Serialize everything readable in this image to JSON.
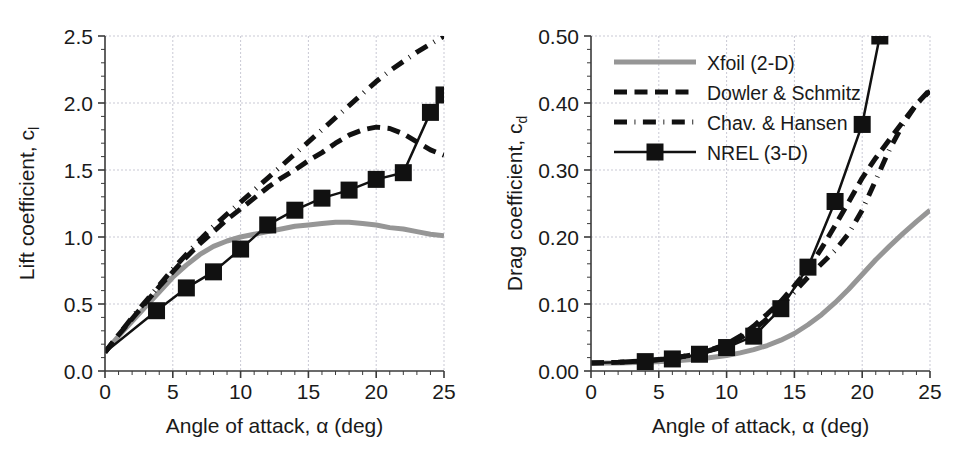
{
  "figure": {
    "background": "#ffffff",
    "panels": [
      "lift",
      "drag"
    ]
  },
  "legend": {
    "position": "top-left-of-right-panel",
    "entries": [
      {
        "label": "Xfoil (2-D)",
        "style": "solid",
        "color": "#969696",
        "marker": "none",
        "width": 5
      },
      {
        "label": "Dowler & Schmitz",
        "style": "dashed",
        "color": "#111111",
        "marker": "none",
        "width": 5
      },
      {
        "label": "Chav. & Hansen",
        "style": "dash-dot",
        "color": "#111111",
        "marker": "none",
        "width": 5
      },
      {
        "label": "NREL (3-D)",
        "style": "solid",
        "color": "#111111",
        "marker": "square",
        "width": 2.5
      }
    ]
  },
  "chart_data": [
    {
      "id": "lift",
      "type": "line",
      "title": "",
      "xlabel": "Angle of attack, α (deg)",
      "ylabel": "Lift coefficient, c",
      "ylabel_sub": "l",
      "xlim": [
        0,
        25
      ],
      "ylim": [
        0.0,
        2.5
      ],
      "xticks": [
        0,
        5,
        10,
        15,
        20,
        25
      ],
      "yticks": [
        0.0,
        0.5,
        1.0,
        1.5,
        2.0,
        2.5
      ],
      "xticklabels": [
        "0",
        "5",
        "10",
        "15",
        "20",
        "25"
      ],
      "yticklabels": [
        "0.0",
        "0.5",
        "1.0",
        "1.5",
        "2.0",
        "2.5"
      ],
      "minor_ticks_per_interval": 5,
      "grid": true,
      "grid_color": "#c9c9d4",
      "legend": false,
      "series": [
        {
          "name": "Xfoil (2-D)",
          "style": "solid",
          "color": "#969696",
          "width": 5,
          "marker": "none",
          "x": [
            0,
            1,
            2,
            3,
            4,
            5,
            6,
            7,
            8,
            9,
            10,
            11,
            12,
            13,
            14,
            15,
            16,
            17,
            18,
            19,
            20,
            21,
            22,
            23,
            24,
            25
          ],
          "y": [
            0.14,
            0.26,
            0.37,
            0.48,
            0.59,
            0.7,
            0.79,
            0.87,
            0.93,
            0.97,
            1.0,
            1.02,
            1.04,
            1.06,
            1.08,
            1.09,
            1.1,
            1.11,
            1.11,
            1.1,
            1.09,
            1.07,
            1.06,
            1.04,
            1.02,
            1.01
          ]
        },
        {
          "name": "Dowler & Schmitz",
          "style": "dashed",
          "color": "#111111",
          "width": 5,
          "marker": "none",
          "x": [
            0,
            1,
            2,
            3,
            4,
            5,
            6,
            7,
            8,
            9,
            10,
            11,
            12,
            13,
            14,
            15,
            16,
            17,
            18,
            19,
            20,
            21,
            22,
            23,
            24,
            25
          ],
          "y": [
            0.14,
            0.27,
            0.39,
            0.51,
            0.63,
            0.74,
            0.85,
            0.95,
            1.04,
            1.13,
            1.21,
            1.29,
            1.37,
            1.44,
            1.5,
            1.57,
            1.63,
            1.7,
            1.76,
            1.8,
            1.82,
            1.81,
            1.77,
            1.71,
            1.65,
            1.61
          ]
        },
        {
          "name": "Chav. & Hansen",
          "style": "dash-dot",
          "color": "#111111",
          "width": 5,
          "marker": "none",
          "x": [
            0,
            1,
            2,
            3,
            4,
            5,
            6,
            7,
            8,
            9,
            10,
            11,
            12,
            13,
            14,
            15,
            16,
            17,
            18,
            19,
            20,
            21,
            22,
            23,
            24,
            25
          ],
          "y": [
            0.14,
            0.27,
            0.4,
            0.52,
            0.64,
            0.76,
            0.87,
            0.98,
            1.08,
            1.17,
            1.26,
            1.35,
            1.44,
            1.53,
            1.62,
            1.71,
            1.8,
            1.89,
            1.98,
            2.07,
            2.16,
            2.24,
            2.31,
            2.38,
            2.44,
            2.5
          ]
        },
        {
          "name": "NREL (3-D)",
          "style": "solid",
          "color": "#111111",
          "width": 2.5,
          "marker": "square",
          "marker_size": 17,
          "x": [
            0,
            3.8,
            6.0,
            8.0,
            10.0,
            12.0,
            14.0,
            16.0,
            18.0,
            20.0,
            22.0,
            24.0,
            25.0
          ],
          "y": [
            0.14,
            0.45,
            0.62,
            0.74,
            0.91,
            1.09,
            1.2,
            1.29,
            1.35,
            1.43,
            1.48,
            1.93,
            2.06
          ]
        }
      ]
    },
    {
      "id": "drag",
      "type": "line",
      "title": "",
      "xlabel": "Angle of attack, α (deg)",
      "ylabel": "Drag coefficient, c",
      "ylabel_sub": "d",
      "xlim": [
        0,
        25
      ],
      "ylim": [
        0.0,
        0.5
      ],
      "xticks": [
        0,
        5,
        10,
        15,
        20,
        25
      ],
      "yticks": [
        0.0,
        0.1,
        0.2,
        0.3,
        0.4,
        0.5
      ],
      "xticklabels": [
        "0",
        "5",
        "10",
        "15",
        "20",
        "25"
      ],
      "yticklabels": [
        "0.00",
        "0.10",
        "0.20",
        "0.30",
        "0.40",
        "0.50"
      ],
      "minor_ticks_per_interval": 5,
      "grid": true,
      "grid_color": "#c9c9d4",
      "legend": true,
      "series": [
        {
          "name": "Xfoil (2-D)",
          "style": "solid",
          "color": "#969696",
          "width": 5,
          "marker": "none",
          "x": [
            0,
            2,
            4,
            6,
            8,
            10,
            11,
            12,
            13,
            14,
            15,
            16,
            17,
            18,
            19,
            20,
            21,
            22,
            23,
            24,
            25
          ],
          "y": [
            0.012,
            0.012,
            0.013,
            0.015,
            0.018,
            0.023,
            0.027,
            0.032,
            0.038,
            0.046,
            0.056,
            0.069,
            0.084,
            0.102,
            0.122,
            0.144,
            0.166,
            0.186,
            0.205,
            0.223,
            0.24
          ]
        },
        {
          "name": "Dowler & Schmitz",
          "style": "dashed",
          "color": "#111111",
          "width": 5,
          "marker": "none",
          "x": [
            0,
            2,
            4,
            6,
            8,
            10,
            11,
            12,
            13,
            14,
            15,
            16,
            17,
            18,
            19,
            20,
            21,
            22,
            23,
            24,
            25
          ],
          "y": [
            0.012,
            0.013,
            0.015,
            0.019,
            0.026,
            0.04,
            0.052,
            0.067,
            0.085,
            0.104,
            0.127,
            0.152,
            0.183,
            0.217,
            0.252,
            0.288,
            0.318,
            0.345,
            0.372,
            0.398,
            0.42
          ]
        },
        {
          "name": "Chav. & Hansen",
          "style": "dash-dot",
          "color": "#111111",
          "width": 5,
          "marker": "none",
          "x": [
            0,
            2,
            4,
            6,
            8,
            10,
            11,
            12,
            13,
            14,
            15,
            16,
            17,
            18,
            19,
            20,
            21,
            22,
            23,
            24,
            25
          ],
          "y": [
            0.012,
            0.013,
            0.015,
            0.019,
            0.026,
            0.039,
            0.049,
            0.062,
            0.078,
            0.097,
            0.118,
            0.14,
            0.16,
            0.18,
            0.205,
            0.24,
            0.285,
            0.33,
            0.368,
            0.398,
            0.418
          ]
        },
        {
          "name": "NREL (3-D)",
          "style": "solid",
          "color": "#111111",
          "width": 2.5,
          "marker": "square",
          "marker_size": 17,
          "x": [
            0,
            4.0,
            6.0,
            8.0,
            10.0,
            12.0,
            14.0,
            16.0,
            18.0,
            20.0,
            21.3
          ],
          "y": [
            0.012,
            0.014,
            0.018,
            0.025,
            0.035,
            0.052,
            0.093,
            0.155,
            0.253,
            0.368,
            0.5
          ]
        }
      ]
    }
  ]
}
